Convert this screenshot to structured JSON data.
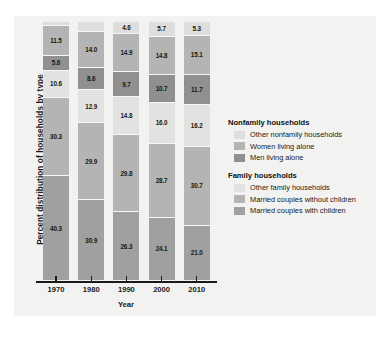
{
  "chart_data": {
    "type": "bar",
    "subtype": "stacked-bar-100",
    "title": "",
    "xlabel": "Year",
    "ylabel": "Percent distribution of households by type",
    "categories": [
      "1970",
      "1980",
      "1990",
      "2000",
      "2010"
    ],
    "ylim": [
      0,
      100
    ],
    "grid": false,
    "legend_position": "right",
    "stack_order_bottom_to_top": [
      "Married couples with children",
      "Married couples without children",
      "Other family households",
      "Men living alone",
      "Women living alone",
      "Other nonfamily households"
    ],
    "series": [
      {
        "name": "Married couples with children",
        "group": "Family households",
        "color": "#a0a0a0",
        "values": [
          40.3,
          30.9,
          26.3,
          24.1,
          21.0
        ]
      },
      {
        "name": "Married couples without children",
        "group": "Family households",
        "color": "#b4b4b4",
        "values": [
          30.3,
          29.9,
          29.8,
          28.7,
          30.7
        ]
      },
      {
        "name": "Other family households",
        "group": "Family households",
        "color": "#e2e2e0",
        "values": [
          10.6,
          12.9,
          14.8,
          16.0,
          16.2
        ]
      },
      {
        "name": "Men living alone",
        "group": "Nonfamily households",
        "color": "#909090",
        "values": [
          5.6,
          8.6,
          9.7,
          10.7,
          11.7
        ]
      },
      {
        "name": "Women living alone",
        "group": "Nonfamily households",
        "color": "#b4b4b4",
        "values": [
          11.5,
          14.0,
          14.9,
          14.8,
          15.1
        ]
      },
      {
        "name": "Other nonfamily households",
        "group": "Nonfamily households",
        "color": "#dedede",
        "values": [
          1.7,
          3.6,
          4.6,
          5.7,
          5.3
        ]
      }
    ],
    "callouts": [
      {
        "category": "1970",
        "series": "Other nonfamily households",
        "value": "1.7"
      },
      {
        "category": "1980",
        "series": "Other nonfamily households",
        "value": "3.6"
      }
    ]
  },
  "axis": {
    "x_label": "Year",
    "y_label": "Percent distribution of households by type",
    "x_ticks": [
      "1970",
      "1980",
      "1990",
      "2000",
      "2010"
    ]
  },
  "legend": {
    "groups": [
      {
        "heading": "Nonfamily households",
        "items": [
          {
            "label": "Other nonfamily households",
            "color": "#dedede"
          },
          {
            "label": "Women living alone",
            "color": "#b4b4b4"
          },
          {
            "label": "Men living alone",
            "color": "#909090"
          }
        ]
      },
      {
        "heading": "Family households",
        "items": [
          {
            "label": "Other family households",
            "color": "#e2e2e0"
          },
          {
            "label": "Married couples without children",
            "color": "#b4b4b4"
          },
          {
            "label": "Married couples with children",
            "color": "#a0a0a0"
          }
        ]
      }
    ]
  },
  "bar_labels": {
    "1970": [
      "40.3",
      "30.3",
      "10.6",
      "5.6",
      "11.5",
      "1.7"
    ],
    "1980": [
      "30.9",
      "29.9",
      "12.9",
      "8.6",
      "14.0",
      "3.6"
    ],
    "1990": [
      "26.3",
      "29.8",
      "14.8",
      "9.7",
      "14.9",
      "4.6"
    ],
    "2000": [
      "24.1",
      "28.7",
      "16.0",
      "10.7",
      "14.8",
      "5.7"
    ],
    "2010": [
      "21.0",
      "30.7",
      "16.2",
      "11.7",
      "15.1",
      "5.3"
    ]
  }
}
